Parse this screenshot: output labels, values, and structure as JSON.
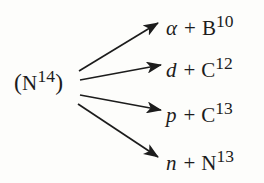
{
  "diagram": {
    "type": "nuclear-reaction-branching-diagram",
    "background_color": "#fdfdfb",
    "ink_color": "#1c1c1c",
    "reactant": {
      "open_paren": "(",
      "symbol": "N",
      "mass_number": "14",
      "close_paren": ")",
      "full_text": "(N14)"
    },
    "products": [
      {
        "particle": "α",
        "plus": "+",
        "nuclide_symbol": "B",
        "nuclide_mass": "10",
        "full_text": "α + B10"
      },
      {
        "particle": "d",
        "plus": "+",
        "nuclide_symbol": "C",
        "nuclide_mass": "12",
        "full_text": "d + C12"
      },
      {
        "particle": "p",
        "plus": "+",
        "nuclide_symbol": "C",
        "nuclide_mass": "13",
        "full_text": "p + C13"
      },
      {
        "particle": "n",
        "plus": "+",
        "nuclide_symbol": "N",
        "nuclide_mass": "13",
        "full_text": "n + N13"
      }
    ],
    "arrows": [
      {
        "name": "arrow-to-alpha-b10",
        "x1": 79,
        "y1": 71,
        "x2": 158,
        "y2": 23
      },
      {
        "name": "arrow-to-d-c12",
        "x1": 80,
        "y1": 80,
        "x2": 161,
        "y2": 65
      },
      {
        "name": "arrow-to-p-c13",
        "x1": 80,
        "y1": 95,
        "x2": 161,
        "y2": 110
      },
      {
        "name": "arrow-to-n-n13",
        "x1": 78,
        "y1": 104,
        "x2": 158,
        "y2": 157
      }
    ]
  }
}
